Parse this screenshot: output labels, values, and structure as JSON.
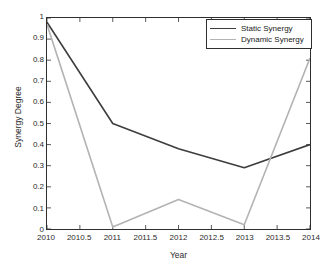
{
  "chart_data": {
    "type": "line",
    "title": "",
    "xlabel": "Year",
    "ylabel": "Synergy Degree",
    "xlim": [
      2010,
      2014
    ],
    "ylim": [
      0,
      1
    ],
    "grid": false,
    "legend_position": "top-right",
    "x": [
      2010,
      2011,
      2012,
      2013,
      2014
    ],
    "xticks": [
      "2010",
      "2010.5",
      "2011",
      "2011.5",
      "2012",
      "2012.5",
      "2013",
      "2013.5",
      "2014"
    ],
    "xtick_values": [
      2010,
      2010.5,
      2011,
      2011.5,
      2012,
      2012.5,
      2013,
      2013.5,
      2014
    ],
    "yticks": [
      "0",
      "0.1",
      "0.2",
      "0.3",
      "0.4",
      "0.5",
      "0.6",
      "0.7",
      "0.8",
      "0.9",
      "1"
    ],
    "ytick_values": [
      0,
      0.1,
      0.2,
      0.3,
      0.4,
      0.5,
      0.6,
      0.7,
      0.8,
      0.9,
      1
    ],
    "series": [
      {
        "name": "Static Synergy",
        "color": "#3d3d3d",
        "values": [
          0.98,
          0.5,
          0.38,
          0.29,
          0.4
        ]
      },
      {
        "name": "Dynamic Synergy",
        "color": "#b3b3b3",
        "values": [
          0.97,
          0.01,
          0.14,
          0.02,
          0.81
        ]
      }
    ]
  },
  "axes": {
    "xlabel": "Year",
    "ylabel": "Synergy Degree"
  },
  "legend": {
    "items": [
      {
        "label": "Static Synergy"
      },
      {
        "label": "Dynamic Synergy"
      }
    ]
  },
  "colors": {
    "static_synergy": "#3d3d3d",
    "dynamic_synergy": "#b3b3b3",
    "axis": "#2e2e2e",
    "background": "#ffffff"
  }
}
